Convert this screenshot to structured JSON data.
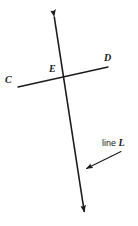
{
  "figure": {
    "background_color": "#ffffff",
    "stroke_color": "#1a1a1a",
    "labels": {
      "point_c": "C",
      "point_d": "D",
      "point_e": "E",
      "callout_prefix": "line",
      "callout_name": "L"
    },
    "geometry": {
      "line_cd": {
        "name": "line-CD",
        "from": [
          18,
          87
        ],
        "to": [
          108,
          67
        ],
        "arrowheads": "none",
        "stroke_width": 1.3
      },
      "line_L": {
        "name": "line-L",
        "from": [
          53,
          9
        ],
        "to": [
          85,
          218
        ],
        "arrowheads": "both",
        "stroke_width": 1.6
      },
      "intersection_point": {
        "name": "point-E",
        "at": [
          63,
          77
        ]
      },
      "callout_arrow": {
        "name": "callout-leader",
        "from": [
          121,
          152
        ],
        "to": [
          84,
          170
        ],
        "arrowheads": "end"
      }
    }
  }
}
